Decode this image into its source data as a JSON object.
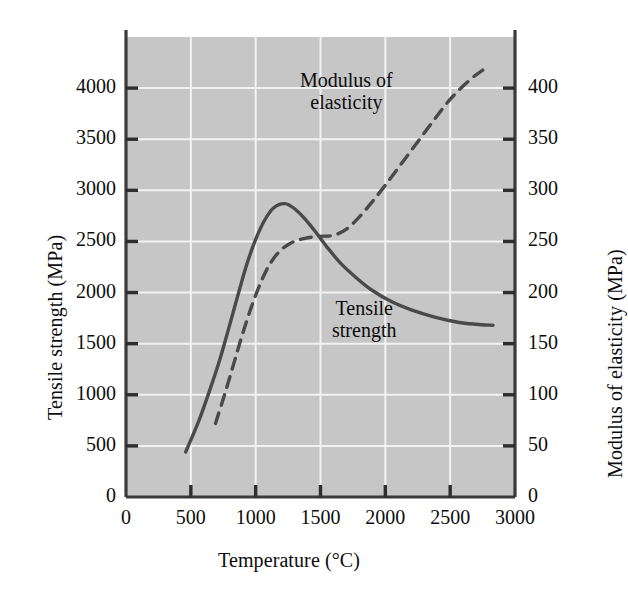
{
  "chart_data": {
    "type": "line",
    "title": "",
    "xlabel": "Temperature (°C)",
    "ylabel": "Tensile strength (MPa)",
    "y2label": "Modulus of elasticity (MPa)",
    "xlim": [
      0,
      3000
    ],
    "ylim": [
      0,
      4500
    ],
    "y2lim": [
      0,
      450
    ],
    "xticks": [
      0,
      500,
      1000,
      1500,
      2000,
      2500,
      3000
    ],
    "xtick_labels": [
      "0",
      "500",
      "1000",
      "1500",
      "2000",
      "2500",
      "3000"
    ],
    "yticks": [
      0,
      500,
      1000,
      1500,
      2000,
      2500,
      3000,
      3500,
      4000
    ],
    "ytick_labels": [
      "0",
      "500",
      "1000",
      "1500",
      "2000",
      "2500",
      "3000",
      "3500",
      "4000"
    ],
    "y2ticks": [
      0,
      50,
      100,
      150,
      200,
      250,
      300,
      350,
      400
    ],
    "y2tick_labels": [
      "0",
      "50",
      "100",
      "150",
      "200",
      "250",
      "300",
      "350",
      "400"
    ],
    "grid": true,
    "grid_color": "#f2f2f2",
    "plot_background": "#c6c6c6",
    "axis_color": "#3a3a3a",
    "series": [
      {
        "name": "Tensile strength",
        "axis": "left",
        "style": "solid",
        "color": "#4a4a4a",
        "label_text_line1": "Tensile",
        "label_text_line2": "strength",
        "points": [
          [
            460,
            440
          ],
          [
            560,
            740
          ],
          [
            650,
            1060
          ],
          [
            720,
            1330
          ],
          [
            790,
            1640
          ],
          [
            860,
            1960
          ],
          [
            930,
            2270
          ],
          [
            1000,
            2520
          ],
          [
            1070,
            2710
          ],
          [
            1140,
            2830
          ],
          [
            1225,
            2870
          ],
          [
            1300,
            2820
          ],
          [
            1380,
            2720
          ],
          [
            1470,
            2580
          ],
          [
            1560,
            2430
          ],
          [
            1660,
            2280
          ],
          [
            1780,
            2140
          ],
          [
            1900,
            2020
          ],
          [
            2050,
            1910
          ],
          [
            2200,
            1830
          ],
          [
            2380,
            1760
          ],
          [
            2560,
            1710
          ],
          [
            2700,
            1690
          ],
          [
            2830,
            1680
          ]
        ]
      },
      {
        "name": "Modulus of elasticity",
        "axis": "right",
        "style": "dashed",
        "color": "#4a4a4a",
        "label_text_line1": "Modulus of",
        "label_text_line2": "elasticity",
        "points": [
          [
            690,
            72
          ],
          [
            760,
            100
          ],
          [
            830,
            130
          ],
          [
            900,
            160
          ],
          [
            970,
            187
          ],
          [
            1040,
            210
          ],
          [
            1110,
            228
          ],
          [
            1190,
            241
          ],
          [
            1280,
            249
          ],
          [
            1380,
            253
          ],
          [
            1490,
            255
          ],
          [
            1600,
            256
          ],
          [
            1700,
            262
          ],
          [
            1800,
            274
          ],
          [
            1900,
            289
          ],
          [
            2000,
            305
          ],
          [
            2100,
            322
          ],
          [
            2200,
            339
          ],
          [
            2300,
            356
          ],
          [
            2400,
            373
          ],
          [
            2500,
            389
          ],
          [
            2600,
            402
          ],
          [
            2700,
            413
          ],
          [
            2780,
            420
          ]
        ]
      }
    ]
  },
  "labels": {
    "modulus_annotation": [
      "Modulus of",
      "elasticity"
    ],
    "tensile_annotation": [
      "Tensile",
      "strength"
    ]
  }
}
